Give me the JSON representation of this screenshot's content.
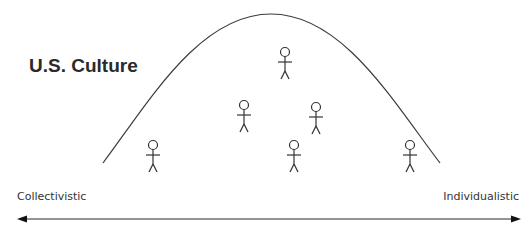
{
  "title": "U.S. Culture",
  "axis": {
    "left_label": "Collectivistic",
    "right_label": "Individualistic"
  },
  "curve": {
    "type": "bell-curve",
    "peak_x": 271,
    "peak_y": 14,
    "left_x": 103,
    "right_x": 440,
    "base_y": 163
  },
  "figures": [
    {
      "id": 1,
      "x": 153,
      "y": 145
    },
    {
      "id": 2,
      "x": 244,
      "y": 105
    },
    {
      "id": 3,
      "x": 285,
      "y": 52
    },
    {
      "id": 4,
      "x": 316,
      "y": 107
    },
    {
      "id": 5,
      "x": 294,
      "y": 145
    },
    {
      "id": 6,
      "x": 410,
      "y": 145
    }
  ],
  "colors": {
    "line": "#3a3a3a",
    "text": "#333333"
  }
}
